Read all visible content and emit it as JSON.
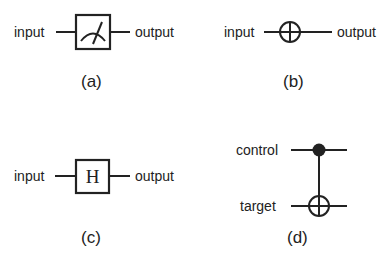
{
  "panels": {
    "a": {
      "input_label": "input",
      "output_label": "output",
      "gate": "measurement-meter",
      "caption": "(a)"
    },
    "b": {
      "input_label": "input",
      "output_label": "output",
      "gate": "xor-oplus",
      "caption": "(b)"
    },
    "c": {
      "input_label": "input",
      "output_label": "output",
      "gate_label": "H",
      "caption": "(c)"
    },
    "d": {
      "control_label": "control",
      "target_label": "target",
      "gate": "cnot",
      "caption": "(d)"
    }
  },
  "colors": {
    "ink": "#222222",
    "background": "#ffffff"
  }
}
